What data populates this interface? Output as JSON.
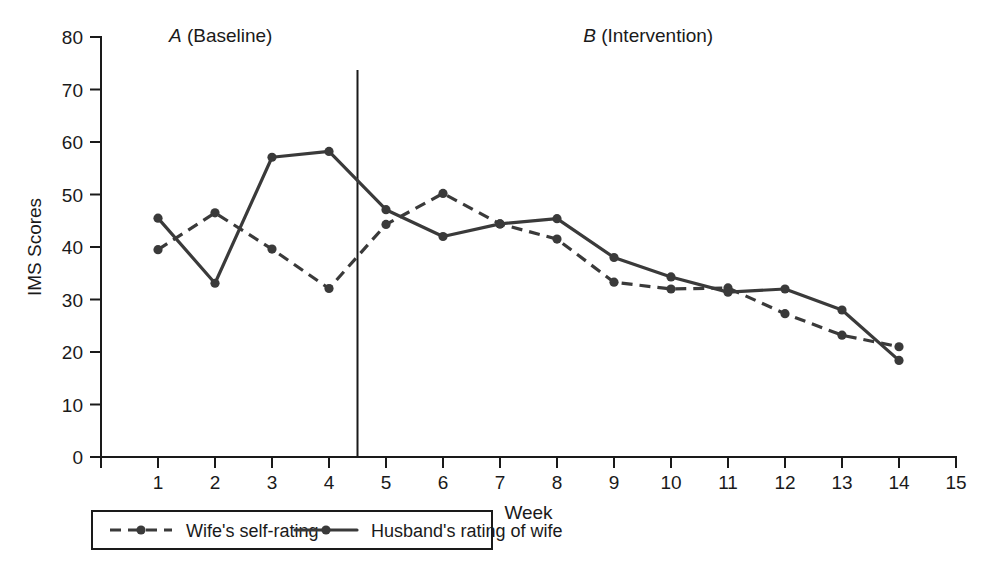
{
  "chart_data": {
    "type": "line",
    "title": "",
    "xlabel": "Week",
    "ylabel": "IMS Scores",
    "xlim": [
      0,
      15
    ],
    "ylim": [
      0,
      80
    ],
    "grid": false,
    "legend_position": "bottom",
    "x": [
      1,
      2,
      3,
      4,
      5,
      6,
      7,
      8,
      9,
      10,
      11,
      12,
      13,
      14
    ],
    "x_ticks": [
      0,
      1,
      2,
      3,
      4,
      5,
      6,
      7,
      8,
      9,
      10,
      11,
      12,
      13,
      14,
      15
    ],
    "x_tick_labels": [
      "",
      "1",
      "2",
      "3",
      "4",
      "5",
      "6",
      "7",
      "8",
      "9",
      "10",
      "11",
      "12",
      "13",
      "14",
      "15"
    ],
    "y_ticks": [
      0,
      10,
      20,
      30,
      40,
      50,
      60,
      70,
      80
    ],
    "y_tick_labels": [
      "0",
      "10",
      "20",
      "30",
      "40",
      "50",
      "60",
      "70",
      "80"
    ],
    "series": [
      {
        "name": "Wife's self-rating",
        "style": "dashed",
        "marker": "circle",
        "color": "#3a3a3a",
        "values": [
          39.5,
          46.5,
          39.6,
          32.1,
          44.3,
          50.2,
          44.4,
          41.5,
          33.3,
          32.0,
          32.2,
          27.3,
          23.2,
          21.0
        ]
      },
      {
        "name": "Husband's rating of wife",
        "style": "solid",
        "marker": "circle",
        "color": "#3a3a3a",
        "values": [
          45.5,
          33.1,
          57.1,
          58.2,
          47.1,
          42.0,
          44.4,
          45.4,
          38.0,
          34.3,
          31.4,
          32.0,
          28.0,
          18.4
        ]
      }
    ],
    "phases": [
      {
        "letter": "A",
        "name": "(Baseline)",
        "x_start": 0,
        "x_end": 4.5
      },
      {
        "letter": "B",
        "name": "(Intervention)",
        "x_start": 4.5,
        "x_end": 15
      }
    ],
    "phase_divider_x": 4.5,
    "annotations": []
  },
  "legend": {
    "entries": [
      {
        "label": "Wife's self-rating",
        "style": "dashed"
      },
      {
        "label": "Husband's rating of wife",
        "style": "solid"
      }
    ]
  },
  "colors": {
    "series": "#3a3a3a",
    "axis": "#1a1a1a",
    "background": "#ffffff"
  }
}
